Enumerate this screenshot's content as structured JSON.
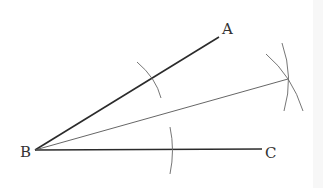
{
  "diagram": {
    "labels": {
      "A": "A",
      "B": "B",
      "C": "C"
    },
    "points": {
      "B": [
        35,
        150
      ],
      "A_end": [
        219,
        37
      ],
      "C_end": [
        262,
        149
      ],
      "bisector_end": [
        287,
        79
      ]
    },
    "colors": {
      "ray": "#2b2b2b",
      "bisector": "#555555",
      "arc": "#666666",
      "label": "#333333"
    }
  }
}
